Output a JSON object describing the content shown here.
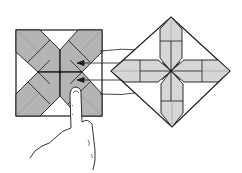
{
  "diagram": {
    "type": "origami-instruction",
    "colors": {
      "background": "#ffffff",
      "paper_gray": "#b4b4b4",
      "paper_light": "#d6d6d6",
      "line": "#1a1a1a",
      "crease": "#8a8a8a"
    },
    "left_figure": {
      "label": "",
      "shape": "square-with-x-flaps"
    },
    "right_figure": {
      "label": "",
      "shape": "diamond-with-four-petals"
    },
    "arrows": [
      {
        "direction": "right",
        "from": "left",
        "to": "right"
      },
      {
        "direction": "left",
        "from": "right",
        "to": "left"
      },
      {
        "direction": "left",
        "from": "right",
        "to": "left"
      },
      {
        "direction": "right",
        "from": "left",
        "to": "right"
      }
    ],
    "hand": {
      "present": true,
      "gesture": "finger-pressing-center"
    }
  }
}
